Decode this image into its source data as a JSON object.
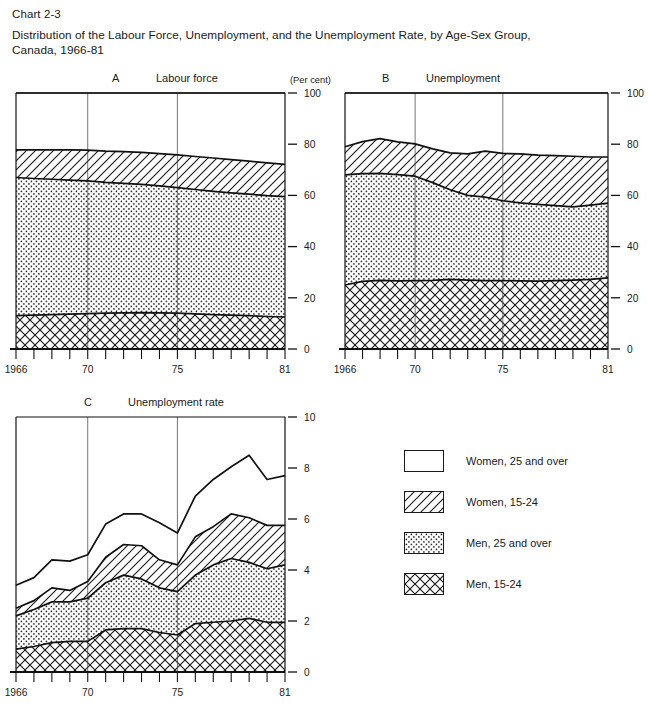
{
  "header": {
    "chart_number": "Chart 2-3",
    "title": "Distribution of the Labour Force, Unemployment, and the Unemployment Rate, by Age-Sex Group, Canada, 1966-81"
  },
  "legend": {
    "items": [
      {
        "label": "Women, 25 and over",
        "pattern": "blank"
      },
      {
        "label": "Women, 15-24",
        "pattern": "diagonal"
      },
      {
        "label": "Men, 25 and over",
        "pattern": "dots"
      },
      {
        "label": "Men, 15-24",
        "pattern": "crosshatch"
      }
    ]
  },
  "chart_data": [
    {
      "type": "area",
      "panel": "A",
      "title": "Labour force",
      "ylabel": "(Per cent)",
      "xlabel": "",
      "ylim": [
        0,
        100
      ],
      "yticks": [
        0,
        20,
        40,
        60,
        80,
        100
      ],
      "xticklabels": [
        "1966",
        "70",
        "75",
        "81"
      ],
      "xtickyears": [
        1966,
        1970,
        1975,
        1981
      ],
      "x": [
        1966,
        1967,
        1968,
        1969,
        1970,
        1971,
        1972,
        1973,
        1974,
        1975,
        1976,
        1977,
        1978,
        1979,
        1980,
        1981
      ],
      "grid": false,
      "stacked": true,
      "series": [
        {
          "name": "Men, 15-24",
          "pattern": "crosshatch",
          "values": [
            13.0,
            13.2,
            13.4,
            13.6,
            13.8,
            14.0,
            14.1,
            14.2,
            14.1,
            14.0,
            13.7,
            13.4,
            13.2,
            13.0,
            12.7,
            12.5
          ]
        },
        {
          "name": "Men, 25 and over",
          "pattern": "dots",
          "values": [
            54.0,
            53.4,
            52.9,
            52.4,
            51.9,
            51.1,
            50.6,
            50.1,
            49.6,
            49.0,
            48.6,
            48.2,
            47.8,
            47.5,
            47.2,
            47.0
          ]
        },
        {
          "name": "Women, 15-24",
          "pattern": "diagonal",
          "values": [
            10.8,
            11.2,
            11.5,
            11.8,
            12.0,
            12.2,
            12.4,
            12.5,
            12.6,
            12.8,
            12.9,
            13.0,
            13.0,
            12.9,
            12.8,
            12.6
          ]
        },
        {
          "name": "Women, 25 and over",
          "pattern": "blank",
          "values": [
            22.2,
            22.2,
            22.2,
            22.2,
            22.3,
            22.7,
            22.9,
            23.2,
            23.7,
            24.2,
            24.8,
            25.4,
            26.0,
            26.6,
            27.3,
            27.9
          ]
        }
      ]
    },
    {
      "type": "area",
      "panel": "B",
      "title": "Unemployment",
      "ylabel": "",
      "xlabel": "",
      "ylim": [
        0,
        100
      ],
      "yticks": [
        0,
        20,
        40,
        60,
        80,
        100
      ],
      "xticklabels": [
        "1966",
        "70",
        "75",
        "81"
      ],
      "xtickyears": [
        1966,
        1970,
        1975,
        1981
      ],
      "x": [
        1966,
        1967,
        1968,
        1969,
        1970,
        1971,
        1972,
        1973,
        1974,
        1975,
        1976,
        1977,
        1978,
        1979,
        1980,
        1981
      ],
      "grid": false,
      "stacked": true,
      "series": [
        {
          "name": "Men, 15-24",
          "pattern": "crosshatch",
          "values": [
            25.0,
            26.4,
            26.8,
            26.6,
            26.7,
            26.8,
            27.2,
            26.9,
            26.7,
            26.7,
            26.6,
            26.5,
            26.7,
            26.9,
            27.2,
            27.8
          ]
        },
        {
          "name": "Men, 25 and over",
          "pattern": "dots",
          "values": [
            43.0,
            42.1,
            41.8,
            41.5,
            40.8,
            38.2,
            35.0,
            33.1,
            32.6,
            31.2,
            30.5,
            30.0,
            29.3,
            28.6,
            29.0,
            29.2
          ]
        },
        {
          "name": "Women, 15-24",
          "pattern": "diagonal",
          "values": [
            11.0,
            12.5,
            13.6,
            12.8,
            12.6,
            13.2,
            14.4,
            16.2,
            18.0,
            18.5,
            19.1,
            19.2,
            19.5,
            19.8,
            18.8,
            18.0
          ]
        },
        {
          "name": "Women, 25 and over",
          "pattern": "blank",
          "values": [
            21.0,
            19.0,
            17.8,
            19.1,
            19.9,
            21.8,
            23.4,
            23.8,
            22.7,
            23.6,
            23.8,
            24.3,
            24.5,
            24.7,
            25.0,
            25.0
          ]
        }
      ]
    },
    {
      "type": "area",
      "panel": "C",
      "title": "Unemployment rate",
      "ylabel": "",
      "xlabel": "",
      "ylim": [
        0,
        10
      ],
      "yticks": [
        0,
        2,
        4,
        6,
        8,
        10
      ],
      "xticklabels": [
        "1966",
        "70",
        "75",
        "81"
      ],
      "xtickyears": [
        1966,
        1970,
        1975,
        1981
      ],
      "x": [
        1966,
        1967,
        1968,
        1969,
        1970,
        1971,
        1972,
        1973,
        1974,
        1975,
        1976,
        1977,
        1978,
        1979,
        1980,
        1981
      ],
      "grid": false,
      "stacked": false,
      "note": "Four overlaid cumulative curves; each curve is the running top of its band.",
      "cumulative_curves": [
        {
          "name": "Men, 15-24",
          "pattern": "crosshatch",
          "values": [
            0.9,
            1.0,
            1.15,
            1.2,
            1.2,
            1.65,
            1.7,
            1.7,
            1.55,
            1.45,
            1.9,
            1.95,
            2.0,
            2.1,
            1.95,
            1.95
          ]
        },
        {
          "name": "Men, 25 and over",
          "pattern": "dots",
          "values": [
            2.2,
            2.45,
            2.75,
            2.75,
            2.9,
            3.5,
            3.8,
            3.65,
            3.3,
            3.15,
            3.8,
            4.2,
            4.45,
            4.3,
            4.05,
            4.2
          ]
        },
        {
          "name": "Women, 15-24",
          "pattern": "diagonal",
          "values": [
            2.5,
            2.8,
            3.3,
            3.2,
            3.55,
            4.5,
            5.0,
            4.95,
            4.4,
            4.2,
            5.3,
            5.7,
            6.2,
            6.05,
            5.75,
            5.75
          ]
        },
        {
          "name": "Women, 25 and over",
          "pattern": "blank",
          "values": [
            3.4,
            3.7,
            4.4,
            4.35,
            4.6,
            5.8,
            6.2,
            6.2,
            5.85,
            5.45,
            6.9,
            7.55,
            8.05,
            8.5,
            7.55,
            7.7
          ]
        }
      ]
    }
  ]
}
